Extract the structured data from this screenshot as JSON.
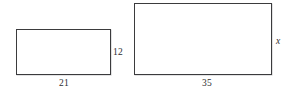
{
  "figure": {
    "type": "geometry-diagram",
    "background_color": "#ffffff",
    "stroke_color": "#3b3b3d",
    "text_color": "#2e2e30",
    "shapes": [
      {
        "name": "small-rectangle",
        "width_label": "21",
        "height_label": "12"
      },
      {
        "name": "large-rectangle",
        "width_label": "35",
        "height_label": "x"
      }
    ]
  },
  "chart_data": {
    "type": "table",
    "title": "",
    "categories": [
      "small rectangle",
      "large rectangle"
    ],
    "series": [
      {
        "name": "width",
        "values": [
          21,
          35
        ]
      },
      {
        "name": "height",
        "values": [
          12,
          null
        ]
      }
    ],
    "annotations": [
      "21",
      "12",
      "35",
      "x"
    ]
  }
}
